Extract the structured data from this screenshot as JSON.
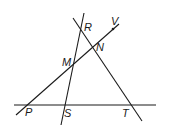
{
  "figure": {
    "lines": [
      {
        "id": "line-rs",
        "x1": 84,
        "y1": 13,
        "x2": 61,
        "y2": 125
      },
      {
        "id": "line-rt",
        "x1": 73,
        "y1": 18,
        "x2": 142,
        "y2": 121
      },
      {
        "id": "line-pv",
        "x1": 16,
        "y1": 115,
        "x2": 119,
        "y2": 24
      },
      {
        "id": "line-pt",
        "x1": 14,
        "y1": 105,
        "x2": 156,
        "y2": 105
      }
    ],
    "points": [
      {
        "name": "R",
        "x": 81,
        "y": 29,
        "lx": 84,
        "ly": 31
      },
      {
        "name": "V",
        "x": 113,
        "y": 29,
        "lx": 111,
        "ly": 25
      },
      {
        "name": "N",
        "x": 93,
        "y": 49,
        "lx": 96,
        "ly": 51
      },
      {
        "name": "M",
        "x": 73,
        "y": 66,
        "lx": 62,
        "ly": 66
      },
      {
        "name": "P",
        "x": 28,
        "y": 105,
        "lx": 25,
        "ly": 116
      },
      {
        "name": "S",
        "x": 65,
        "y": 105,
        "lx": 64,
        "ly": 117
      },
      {
        "name": "T",
        "x": 132,
        "y": 105,
        "lx": 122,
        "ly": 117
      }
    ]
  }
}
